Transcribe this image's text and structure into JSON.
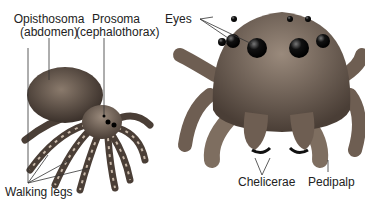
{
  "labels": {
    "opisthosoma": "Opisthosoma",
    "opisthosoma_sub": "(abdomen)",
    "prosoma": "Prosoma",
    "prosoma_sub": "(cephalothorax)",
    "eyes": "Eyes",
    "chelicerae": "Chelicerae",
    "pedipalp": "Pedipalp",
    "walking_legs": "Walking legs"
  },
  "colors": {
    "body_dark": "#3a302a",
    "body_mid": "#6e5e52",
    "body_light": "#a89888",
    "eye": "#111111",
    "leader": "#333333"
  }
}
